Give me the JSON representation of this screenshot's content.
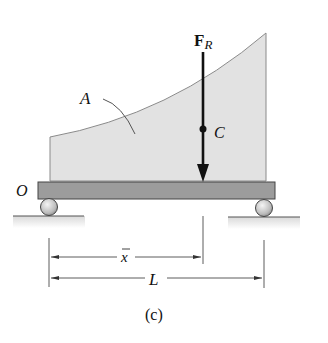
{
  "figure": {
    "caption": "(c)",
    "labels": {
      "force": "F",
      "force_subscript": "R",
      "centroid": "C",
      "area": "A",
      "origin": "O",
      "xbar": "x",
      "length": "L"
    },
    "colors": {
      "area_fill": "#e2e2e2",
      "area_stroke": "#8a8a8a",
      "beam_fill": "#9c9c9c",
      "beam_stroke": "#444444",
      "roller_fill": "#cfcfcf",
      "ground": "#555555",
      "ink": "#111111"
    }
  }
}
